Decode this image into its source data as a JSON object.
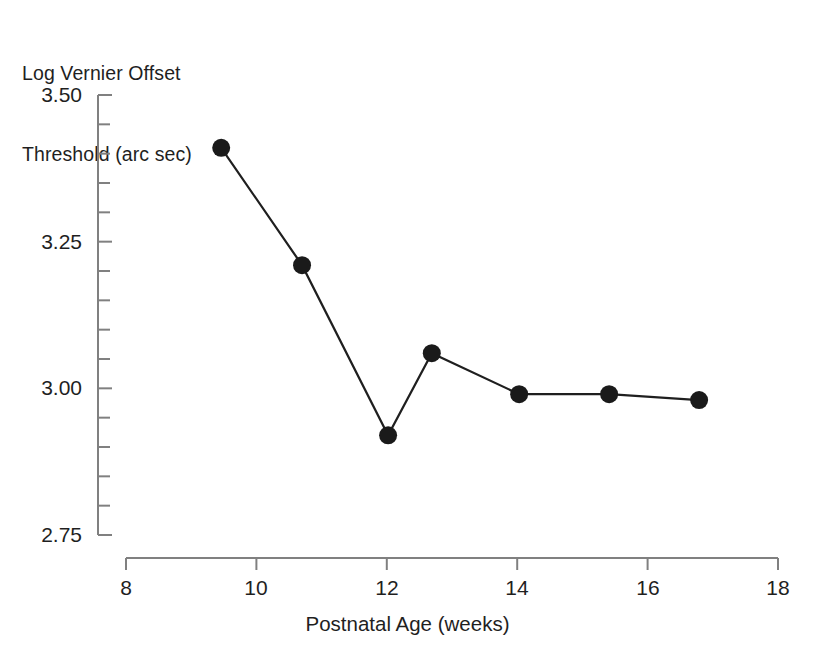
{
  "chart_data": {
    "type": "line",
    "title": "",
    "subtitle": "",
    "xlabel": "Postnatal Age (weeks)",
    "ylabel": "Log Vernier Offset\nThreshold (arc sec)",
    "ylabel_lines": [
      "Log Vernier Offset",
      "Threshold (arc sec)"
    ],
    "xlim": [
      8,
      18
    ],
    "ylim": [
      2.75,
      3.5
    ],
    "xticks": [
      8,
      10,
      12,
      14,
      16,
      18
    ],
    "xtick_labels": [
      "8",
      "10",
      "12",
      "14",
      "16",
      "18"
    ],
    "yticks": [
      2.75,
      3.0,
      3.25,
      3.5
    ],
    "ytick_labels": [
      "2.75",
      "3.00",
      "3.25",
      "3.50"
    ],
    "y_minor_step": 0.05,
    "grid": false,
    "legend": null,
    "series": [
      {
        "name": "Vernier offset threshold",
        "marker": "filled-circle",
        "marker_size": 9,
        "color": "#1a1a1a",
        "line_color": "#1f1f1f",
        "x": [
          9.46,
          10.7,
          12.02,
          12.69,
          14.03,
          15.41,
          16.79
        ],
        "y": [
          3.41,
          3.21,
          2.92,
          3.06,
          2.99,
          2.99,
          2.98
        ],
        "points": [
          {
            "x": 9.46,
            "y": 3.41
          },
          {
            "x": 10.7,
            "y": 3.21
          },
          {
            "x": 12.02,
            "y": 2.92
          },
          {
            "x": 12.69,
            "y": 3.06
          },
          {
            "x": 14.03,
            "y": 2.99
          },
          {
            "x": 15.41,
            "y": 2.99
          },
          {
            "x": 16.79,
            "y": 2.98
          }
        ]
      }
    ],
    "colors": {
      "axis": "#808080",
      "marker": "#1a1a1a",
      "line": "#1f1f1f",
      "text": "#1f1f1f",
      "background": "#ffffff"
    }
  }
}
